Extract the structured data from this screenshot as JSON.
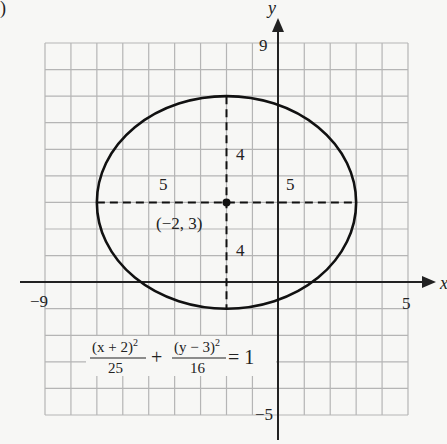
{
  "figure_label": ")",
  "chart_data": {
    "type": "line",
    "title": "",
    "xlabel": "x",
    "ylabel": "y",
    "xlim": [
      -9,
      5
    ],
    "ylim": [
      -5,
      9
    ],
    "grid": true,
    "tick_labels": {
      "x_min": "−9",
      "x_max": "5",
      "y_max": "9",
      "y_min": "−5"
    },
    "ellipse": {
      "center": [
        -2,
        3
      ],
      "center_label": "(−2, 3)",
      "a": 5,
      "b": 4,
      "horizontal_semi_axis_labels": [
        "5",
        "5"
      ],
      "vertical_semi_axis_labels": [
        "4",
        "4"
      ]
    },
    "equation": {
      "term1_num": "(x + 2)",
      "term1_exp": "2",
      "term1_den": "25",
      "plus": "+",
      "term2_num": "(y − 3)",
      "term2_exp": "2",
      "term2_den": "16",
      "equals": "= 1"
    },
    "colors": {
      "grid": "#b5b5b5",
      "axis": "#222222",
      "curve": "#111111",
      "background": "#f7f7f5"
    }
  }
}
